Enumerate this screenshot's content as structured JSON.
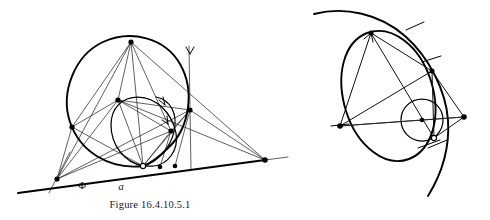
{
  "document": {
    "type": "geometry-figure-plate",
    "background_color": "#ffffff",
    "ink_color": "#000000",
    "figure_count": 2
  },
  "figures": [
    {
      "id": "figure-left",
      "caption": "Figure 16.4.10.5.1",
      "labels": [
        {
          "name": "phi-label",
          "text": "Φ",
          "x": 82,
          "y": 189,
          "style": "greek"
        },
        {
          "name": "a-label",
          "text": "a",
          "x": 121,
          "y": 190,
          "style": "math"
        }
      ],
      "elements": {
        "large_conic": "heavy closed oval tilted, upper-left region",
        "small_conic": "heavy closed oval, lower-right inside large oval",
        "baseline": "thick straight line running lower-left to right vertex",
        "pencil_of_lines": "thin lines converging at left vertex and right vertex",
        "vertical_line_with_arrow": "near-vertical line at right with downward arrow head",
        "arrow_count": 3
      }
    },
    {
      "id": "figure-right",
      "caption": "Figure 16.4.10.5.2",
      "labels": [],
      "elements": {
        "outer_arc": "large open arc sweeping from upper-left to lower-right",
        "ellipse": "tilted ellipse, major axis upper-right to lower-left",
        "circle": "small circle tangent inside ellipse at lower right",
        "chords": "thin straight chords joining marked points",
        "tangent_ticks": "short cross ticks at tangency points",
        "arrow_count": 1
      }
    }
  ],
  "captions": {
    "left": "Figure 16.4.10.5.1",
    "right": "Figure 16.4.10.5.2"
  },
  "colors": {
    "ink": "#000000",
    "thin_ink": "#2b2b2b",
    "paper": "#ffffff"
  }
}
